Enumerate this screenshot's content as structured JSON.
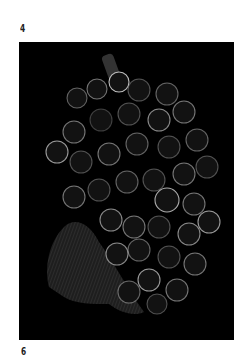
{
  "labels": {
    "top": "4",
    "bottom": "6"
  },
  "figure": {
    "background_color": "#000000",
    "outline_color": "#bdbdbd",
    "berry_fill": "#141414",
    "leaf_fill": "#2a2a2a"
  }
}
